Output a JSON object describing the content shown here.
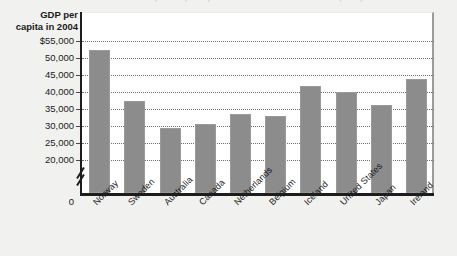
{
  "figure": {
    "clipped_title": "Gross domestic product per capita for the world's richest countries (2004)",
    "axis_title_line1": "GDP per",
    "axis_title_line2": "capita in 2004",
    "zero_label": "0"
  },
  "chart_data": {
    "type": "bar",
    "title": "GDP per capita in 2004",
    "xlabel": "",
    "ylabel": "GDP per capita in 2004",
    "categories": [
      "Norway",
      "Sweden",
      "Australia",
      "Canada",
      "Netherlands",
      "Belgium",
      "Iceland",
      "United States",
      "Japan",
      "Ireland"
    ],
    "values": [
      52500,
      37500,
      29500,
      30500,
      33500,
      33000,
      41700,
      40000,
      36300,
      43800
    ],
    "tick_labels": [
      "$55,000",
      "50,000",
      "45,000",
      "40,000",
      "35,000",
      "30,000",
      "25,000",
      "20,000"
    ],
    "tick_values": [
      55000,
      50000,
      45000,
      40000,
      35000,
      30000,
      25000,
      20000
    ],
    "ylim": [
      20000,
      55000
    ],
    "axis_break": true,
    "baseline_label": "0",
    "grid": true,
    "grid_style": "dotted",
    "legend": "none",
    "bar_color": "#8c8c8c",
    "plot_background": "#ffffff",
    "page_background": "#f1f1ef",
    "axis_color": "#1d1d1d"
  }
}
